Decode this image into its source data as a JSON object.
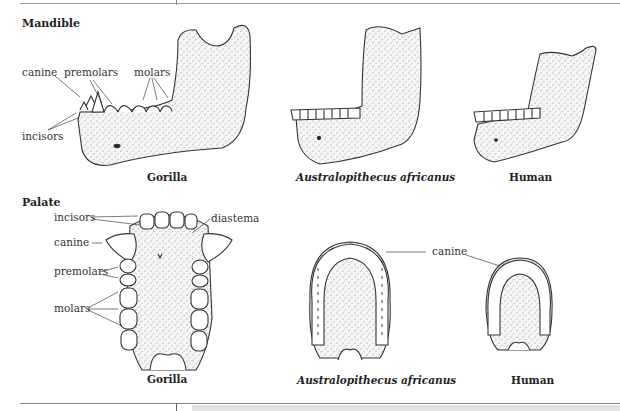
{
  "figure": {
    "sections": [
      {
        "title": "Mandible",
        "species": [
          {
            "name": "Gorilla",
            "italic": false
          },
          {
            "name": "Australopithecus africanus",
            "italic": true
          },
          {
            "name": "Human",
            "italic": false
          }
        ],
        "labels": [
          "canine",
          "premolars",
          "molars",
          "incisors"
        ]
      },
      {
        "title": "Palate",
        "species": [
          {
            "name": "Gorilla",
            "italic": false
          },
          {
            "name": "Australopithecus africanus",
            "italic": true
          },
          {
            "name": "Human",
            "italic": false
          }
        ],
        "labels": [
          "incisors",
          "diastema",
          "canine",
          "premolars",
          "molars",
          "canine"
        ]
      }
    ]
  }
}
